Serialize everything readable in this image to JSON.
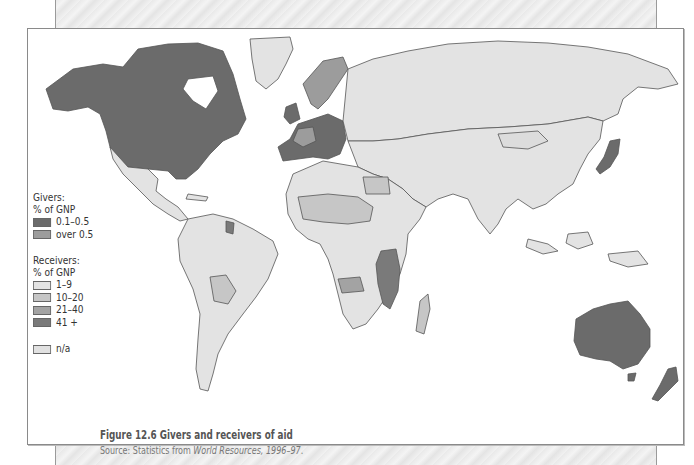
{
  "figure": {
    "title": "Figure 12.6 Givers and receivers of aid",
    "source_prefix": "Source: Statistics from ",
    "source_work": "World Resources, 1996–97",
    "source_suffix": "."
  },
  "legend": {
    "givers": {
      "heading_1": "Givers:",
      "heading_2": "% of GNP",
      "items": [
        {
          "label": "0.1–0.5",
          "color": "#6b6b6b"
        },
        {
          "label": "over  0.5",
          "color": "#9c9c9c"
        }
      ]
    },
    "receivers": {
      "heading_1": "Receivers:",
      "heading_2": "% of GNP",
      "items": [
        {
          "label": "1–9",
          "color": "#e3e3e3"
        },
        {
          "label": "10–20",
          "color": "#c6c6c6"
        },
        {
          "label": "21–40",
          "color": "#a3a3a3"
        },
        {
          "label": "41 +",
          "color": "#7a7a7a"
        }
      ]
    },
    "na": {
      "label": "n/a",
      "color": "#e1e1e1"
    }
  },
  "colors": {
    "giver_low": "#6b6b6b",
    "giver_high": "#9c9c9c",
    "recv_1_9": "#e3e3e3",
    "recv_10_20": "#c6c6c6",
    "recv_21_40": "#a3a3a3",
    "recv_41": "#7a7a7a",
    "border": "#555555"
  },
  "map_regions": [
    {
      "name": "north-america",
      "category": "giver_low"
    },
    {
      "name": "greenland",
      "category": "recv_1_9"
    },
    {
      "name": "mexico-central-america",
      "category": "recv_1_9"
    },
    {
      "name": "south-america",
      "category": "recv_1_9"
    },
    {
      "name": "bolivia",
      "category": "recv_10_20"
    },
    {
      "name": "western-europe",
      "category": "giver_low"
    },
    {
      "name": "scandinavia",
      "category": "giver_high"
    },
    {
      "name": "eastern-europe-russia",
      "category": "recv_1_9"
    },
    {
      "name": "africa",
      "category": "recv_1_9"
    },
    {
      "name": "east-africa-high-aid",
      "category": "recv_41"
    },
    {
      "name": "sahel",
      "category": "recv_10_20"
    },
    {
      "name": "madagascar",
      "category": "recv_10_20"
    },
    {
      "name": "middle-east-asia",
      "category": "recv_1_9"
    },
    {
      "name": "japan",
      "category": "giver_low"
    },
    {
      "name": "southeast-asia",
      "category": "recv_1_9"
    },
    {
      "name": "australia",
      "category": "giver_low"
    },
    {
      "name": "new-zealand",
      "category": "giver_low"
    }
  ]
}
